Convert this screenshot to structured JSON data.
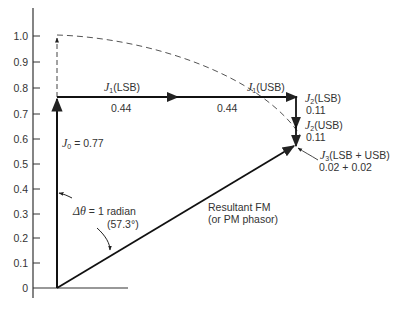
{
  "figure": {
    "y_axis": {
      "ticks": [
        "1.0",
        "0.9",
        "0.8",
        "0.7",
        "0.6",
        "0.5",
        "0.4",
        "0.3",
        "0.2",
        "0.1",
        "0"
      ]
    },
    "labels": {
      "j0": {
        "symbol": "J",
        "sub": "0",
        "text": " = 0.77"
      },
      "j1_lsb": {
        "symbol": "J",
        "sub": "1",
        "text": "(LSB)",
        "value": "0.44"
      },
      "j1_usb": {
        "symbol": "J",
        "sub": "1",
        "text": "(USB)",
        "value": "0.44"
      },
      "j2_lsb": {
        "symbol": "J",
        "sub": "2",
        "text": "(LSB)",
        "value": "0.11"
      },
      "j2_usb": {
        "symbol": "J",
        "sub": "2",
        "text": "(USB)",
        "value": "0.11"
      },
      "j3": {
        "symbol": "J",
        "sub": "3",
        "text": "(LSB + USB)",
        "value": "0.02 + 0.02"
      },
      "angle": {
        "line1_symbol": "Δθ",
        "line1_text": " = 1 radian",
        "line2": "(57.3°)"
      },
      "resultant": {
        "line1": "Resultant FM",
        "line2": "(or PM phasor)"
      }
    }
  }
}
